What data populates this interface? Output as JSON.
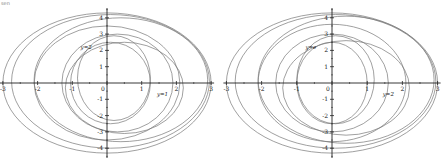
{
  "figure": {
    "top_fragment": "sen"
  },
  "chart_data": [
    {
      "type": "line",
      "panel": "left",
      "title": "",
      "xlabel": "",
      "ylabel": "",
      "xlim": [
        -3,
        3
      ],
      "ylim": [
        -4.5,
        4.5
      ],
      "grid": false,
      "x_ticks": [
        "-3",
        "-2",
        "-1",
        "0",
        "1",
        "2",
        "3"
      ],
      "y_ticks": [
        "4",
        "3",
        "2",
        "1",
        "-1",
        "-2",
        "-3",
        "-4"
      ],
      "annotations": [
        {
          "text": "y=2",
          "x": -0.6,
          "y": 2.1
        },
        {
          "text": "y=1",
          "x": 1.6,
          "y": -0.8
        }
      ],
      "series": [
        {
          "name": "curve-1",
          "cx": 0.1,
          "cy": 0.0,
          "rx": 1.15,
          "ry": 2.5
        },
        {
          "name": "curve-2",
          "cx": 0.2,
          "cy": 0.3,
          "rx": 1.05,
          "ry": 2.6
        },
        {
          "name": "curve-3",
          "cx": 0.3,
          "cy": 0.0,
          "rx": 1.6,
          "ry": 3.0
        },
        {
          "name": "curve-4",
          "cx": 0.5,
          "cy": -0.3,
          "rx": 1.7,
          "ry": 2.8
        },
        {
          "name": "curve-5",
          "cx": 0.0,
          "cy": 0.0,
          "rx": 2.1,
          "ry": 3.5
        },
        {
          "name": "curve-6",
          "cx": 0.4,
          "cy": 0.2,
          "rx": 2.5,
          "ry": 3.8
        },
        {
          "name": "curve-7",
          "cx": 0.0,
          "cy": 0.0,
          "rx": 3.0,
          "ry": 4.3
        },
        {
          "name": "curve-8",
          "cx": 0.1,
          "cy": 0.1,
          "rx": 2.85,
          "ry": 4.1
        }
      ]
    },
    {
      "type": "line",
      "panel": "right",
      "title": "",
      "xlabel": "",
      "ylabel": "",
      "xlim": [
        -3,
        3
      ],
      "ylim": [
        -4.5,
        4.5
      ],
      "grid": false,
      "x_ticks": [
        "-3",
        "-2",
        "-1",
        "0",
        "1",
        "2",
        "3"
      ],
      "y_ticks": [
        "4",
        "3",
        "2",
        "1",
        "-1",
        "-2",
        "-3",
        "-4"
      ],
      "annotations": [
        {
          "text": "y=e",
          "x": -0.6,
          "y": 2.1
        },
        {
          "text": "y=2",
          "x": 1.6,
          "y": -0.8
        }
      ],
      "series": [
        {
          "name": "curve-1",
          "cx": 0.0,
          "cy": 0.0,
          "rx": 1.0,
          "ry": 2.5
        },
        {
          "name": "curve-2",
          "cx": 0.1,
          "cy": 0.2,
          "rx": 1.1,
          "ry": 2.7
        },
        {
          "name": "curve-3",
          "cx": 0.0,
          "cy": 0.0,
          "rx": 1.6,
          "ry": 3.0
        },
        {
          "name": "curve-4",
          "cx": 0.4,
          "cy": -0.3,
          "rx": 1.8,
          "ry": 2.9
        },
        {
          "name": "curve-5",
          "cx": 0.0,
          "cy": 0.0,
          "rx": 2.1,
          "ry": 3.6
        },
        {
          "name": "curve-6",
          "cx": 0.4,
          "cy": 0.2,
          "rx": 2.5,
          "ry": 3.9
        },
        {
          "name": "curve-7",
          "cx": 0.0,
          "cy": 0.0,
          "rx": 3.0,
          "ry": 4.3
        },
        {
          "name": "curve-8",
          "cx": 0.1,
          "cy": 0.1,
          "rx": 2.85,
          "ry": 4.1
        }
      ]
    }
  ],
  "style": {
    "curve_color": "#777777",
    "axis_color": "#222222",
    "label_color": "#222222"
  },
  "layout": {
    "panels": [
      {
        "left": 0,
        "width": 221,
        "origin_x": 107,
        "origin_y": 83,
        "px_per_x": 34.7,
        "px_per_y": 16.3
      },
      {
        "left": 221,
        "width": 221,
        "origin_x": 111,
        "origin_y": 83,
        "px_per_x": 35.2,
        "px_per_y": 16.3
      }
    ]
  }
}
